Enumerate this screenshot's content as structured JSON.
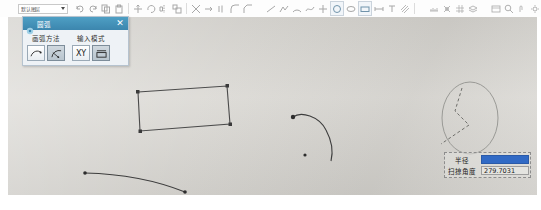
{
  "app": {
    "type": "cad-drawing-application",
    "canvas_bg": "#d9d7d2"
  },
  "toolbar": {
    "dropdown": {
      "name": "layer-selector",
      "value": "默认图层",
      "arrow_icon": "chevron-down-icon"
    },
    "icons": [
      {
        "name": "undo-icon"
      },
      {
        "name": "redo-icon"
      },
      {
        "name": "copy-icon"
      },
      {
        "name": "paste-icon"
      },
      {
        "name": "move-icon"
      },
      {
        "name": "rotate-icon"
      },
      {
        "name": "mirror-icon"
      },
      {
        "name": "scale-icon"
      },
      {
        "name": "trim-icon"
      },
      {
        "name": "extend-icon"
      },
      {
        "name": "offset-icon"
      },
      {
        "name": "fillet-icon"
      },
      {
        "name": "chamfer-icon"
      },
      {
        "name": "line-icon"
      },
      {
        "name": "polyline-icon"
      },
      {
        "name": "arc-icon"
      },
      {
        "name": "spline-icon"
      },
      {
        "name": "point-icon"
      },
      {
        "name": "circle-icon"
      },
      {
        "name": "ellipse-icon"
      },
      {
        "name": "rectangle-icon"
      },
      {
        "name": "dimension-icon"
      },
      {
        "name": "text-icon"
      },
      {
        "name": "hatch-icon"
      },
      {
        "name": "measure-icon"
      },
      {
        "name": "snap-icon"
      },
      {
        "name": "grid-icon"
      },
      {
        "name": "layer-icon"
      },
      {
        "name": "properties-icon"
      },
      {
        "name": "zoom-icon"
      },
      {
        "name": "pan-icon"
      },
      {
        "name": "settings-icon"
      }
    ]
  },
  "dialog": {
    "title": "圆弧",
    "gear_icon": "gear-icon",
    "close_label": "✕",
    "groups": [
      {
        "label": "画弧方法",
        "buttons": [
          {
            "name": "arc-three-point-button",
            "icon": "arc-curve-icon",
            "active": false
          },
          {
            "name": "arc-center-radius-button",
            "icon": "arc-radius-icon",
            "active": true
          }
        ]
      },
      {
        "label": "输入模式",
        "buttons": [
          {
            "name": "input-mode-xy-button",
            "icon": "xy-label",
            "label": "XY",
            "active": false
          },
          {
            "name": "input-mode-parametric-button",
            "icon": "parametric-icon",
            "active": true
          }
        ]
      }
    ]
  },
  "measurement_panel": {
    "rows": [
      {
        "label": "半径",
        "value": "33.01766",
        "selected": true,
        "name": "radius-field"
      },
      {
        "label": "扫掠角度",
        "value": "279.7031",
        "selected": false,
        "name": "sweep-angle-field"
      }
    ]
  },
  "geometry": {
    "rectangle": {
      "name": "rectangle-shape",
      "points": "138,92 227,86 230,124 140,131"
    },
    "arc_middle": {
      "name": "arc-shape",
      "path": "M 293,117 C 300,112 318,115 325,128 C 332,141 332,152 330,160"
    },
    "arc_middle_start_marker": {
      "cx": 293,
      "cy": 117
    },
    "arc_middle_center_marker": {
      "cx": 305,
      "cy": 155
    },
    "curve_bottom": {
      "name": "curve-shape",
      "path": "M 85,173 C 125,174 160,182 184,192"
    },
    "curve_start_marker": {
      "cx": 85,
      "cy": 173
    },
    "curve_end_marker": {
      "cx": 184,
      "cy": 192
    },
    "circle_preview": {
      "name": "circle-preview-shape",
      "cx": 470,
      "cy": 118,
      "rx": 28,
      "ry": 36
    },
    "radius_guides": {
      "name": "radius-guide-lines",
      "path": "M 462,88 L 455,110 L 468,124 M 468,124 L 440,143"
    }
  }
}
